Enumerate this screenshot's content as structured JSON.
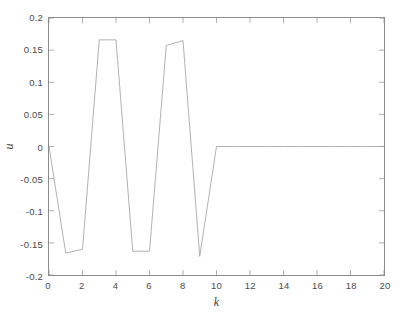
{
  "chart_data": {
    "type": "line",
    "title": "",
    "xlabel": "k",
    "ylabel": "u",
    "xlim": [
      0,
      20
    ],
    "ylim": [
      -0.2,
      0.2
    ],
    "xticks": [
      0,
      2,
      4,
      6,
      8,
      10,
      12,
      14,
      16,
      18,
      20
    ],
    "xtick_labels": [
      "0",
      "2",
      "4",
      "6",
      "8",
      "10",
      "12",
      "14",
      "16",
      "18",
      "20"
    ],
    "yticks": [
      0.2,
      0.15,
      0.1,
      0.05,
      0,
      -0.05,
      -0.1,
      -0.15,
      -0.2
    ],
    "ytick_labels": [
      "0.2",
      "0.15",
      "0.1",
      "0.05",
      "0",
      "-0.05",
      "-0.1",
      "-0.15",
      "-0.2"
    ],
    "grid": false,
    "legend": null,
    "tick_direction": "in",
    "box": true,
    "line_color": "#9e9e9e",
    "line_width": 0.8,
    "series": [
      {
        "name": "u",
        "x": [
          0,
          1,
          2,
          3,
          4,
          5,
          6,
          7,
          8,
          9,
          10,
          11,
          12,
          13,
          14,
          15,
          16,
          17,
          18,
          19,
          20
        ],
        "values": [
          0.0,
          -0.166,
          -0.16,
          0.166,
          0.166,
          -0.163,
          -0.163,
          0.157,
          0.165,
          -0.171,
          0.0,
          0.0,
          0.0,
          0.0,
          0.0,
          0.0,
          0.0,
          0.0,
          0.0,
          0.0,
          0.0
        ]
      }
    ]
  },
  "colors": {
    "axis": "#8c8c8c",
    "tick_text": "#4a4a4a",
    "label_text": "#3d3d3d",
    "line": "#9e9e9e",
    "background": "#ffffff"
  }
}
